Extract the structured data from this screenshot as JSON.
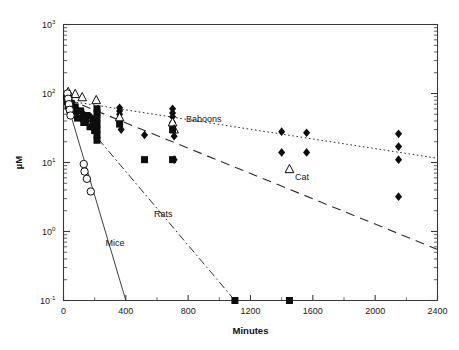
{
  "chart_data": {
    "type": "scatter",
    "title": "",
    "subtitle": "",
    "xlabel": "Minutes",
    "ylabel": "µM",
    "xlim": [
      0,
      2400
    ],
    "ylim": [
      0.1,
      1000
    ],
    "yscale": "log",
    "xscale": "linear",
    "grid": false,
    "legend_position": "inline-annotations",
    "xticks": [
      0,
      400,
      800,
      1200,
      1600,
      2000,
      2400
    ],
    "xtick_labels": [
      "0",
      "400",
      "800",
      "1200",
      "1600",
      "2000",
      "2400"
    ],
    "x_minor_tick_interval": 200,
    "yticks": [
      0.1,
      1,
      10,
      100,
      1000
    ],
    "ytick_labels": [
      "10-1",
      "100",
      "101",
      "102",
      "103"
    ],
    "ytick_mantissa": [
      "10",
      "10",
      "10",
      "10",
      "10"
    ],
    "ytick_exponent": [
      "-1",
      "0",
      "1",
      "2",
      "3"
    ],
    "annotations": [
      {
        "text": "Baboons",
        "x": 900,
        "y": 38
      },
      {
        "text": "Cat",
        "x": 1530,
        "y": 5.5
      },
      {
        "text": "Rats",
        "x": 640,
        "y": 1.6
      },
      {
        "text": "Mice",
        "x": 330,
        "y": 0.62
      }
    ],
    "series": [
      {
        "name": "Baboons",
        "marker": "filled-diamond",
        "line_style": "dotted",
        "fit_line": {
          "x": [
            30,
            2400
          ],
          "y": [
            78,
            11.5
          ]
        },
        "points": [
          {
            "x": 20,
            "y": 96
          },
          {
            "x": 25,
            "y": 88
          },
          {
            "x": 30,
            "y": 80
          },
          {
            "x": 30,
            "y": 62
          },
          {
            "x": 40,
            "y": 70
          },
          {
            "x": 45,
            "y": 58
          },
          {
            "x": 55,
            "y": 66
          },
          {
            "x": 60,
            "y": 52
          },
          {
            "x": 70,
            "y": 60
          },
          {
            "x": 80,
            "y": 48
          },
          {
            "x": 95,
            "y": 56
          },
          {
            "x": 110,
            "y": 44
          },
          {
            "x": 130,
            "y": 50
          },
          {
            "x": 150,
            "y": 40
          },
          {
            "x": 175,
            "y": 46
          },
          {
            "x": 190,
            "y": 36
          },
          {
            "x": 360,
            "y": 62
          },
          {
            "x": 360,
            "y": 56
          },
          {
            "x": 360,
            "y": 50
          },
          {
            "x": 360,
            "y": 42
          },
          {
            "x": 370,
            "y": 30
          },
          {
            "x": 520,
            "y": 25
          },
          {
            "x": 700,
            "y": 60
          },
          {
            "x": 700,
            "y": 52
          },
          {
            "x": 700,
            "y": 46
          },
          {
            "x": 700,
            "y": 38
          },
          {
            "x": 710,
            "y": 24
          },
          {
            "x": 710,
            "y": 11
          },
          {
            "x": 1400,
            "y": 28
          },
          {
            "x": 1400,
            "y": 14
          },
          {
            "x": 1560,
            "y": 27
          },
          {
            "x": 1560,
            "y": 14
          },
          {
            "x": 2150,
            "y": 26
          },
          {
            "x": 2150,
            "y": 17
          },
          {
            "x": 2150,
            "y": 11
          },
          {
            "x": 2150,
            "y": 3.2
          }
        ]
      },
      {
        "name": "Cat",
        "marker": "open-triangle",
        "line_style": "dashed",
        "fit_line": {
          "x": [
            30,
            2400
          ],
          "y": [
            82,
            0.55
          ]
        },
        "points": [
          {
            "x": 30,
            "y": 105
          },
          {
            "x": 75,
            "y": 98
          },
          {
            "x": 120,
            "y": 88
          },
          {
            "x": 210,
            "y": 80
          },
          {
            "x": 360,
            "y": 45
          },
          {
            "x": 700,
            "y": 38
          },
          {
            "x": 710,
            "y": 30
          },
          {
            "x": 1450,
            "y": 8.0
          }
        ]
      },
      {
        "name": "Rats",
        "marker": "filled-square",
        "line_style": "dash-dot",
        "fit_line": {
          "x": [
            30,
            1100
          ],
          "y": [
            72,
            0.1
          ]
        },
        "points": [
          {
            "x": 20,
            "y": 92
          },
          {
            "x": 25,
            "y": 76
          },
          {
            "x": 30,
            "y": 66
          },
          {
            "x": 35,
            "y": 84
          },
          {
            "x": 40,
            "y": 58
          },
          {
            "x": 50,
            "y": 72
          },
          {
            "x": 60,
            "y": 50
          },
          {
            "x": 75,
            "y": 64
          },
          {
            "x": 90,
            "y": 44
          },
          {
            "x": 110,
            "y": 56
          },
          {
            "x": 130,
            "y": 38
          },
          {
            "x": 150,
            "y": 48
          },
          {
            "x": 170,
            "y": 33
          },
          {
            "x": 190,
            "y": 42
          },
          {
            "x": 200,
            "y": 29
          },
          {
            "x": 215,
            "y": 60
          },
          {
            "x": 215,
            "y": 52
          },
          {
            "x": 215,
            "y": 44
          },
          {
            "x": 215,
            "y": 36
          },
          {
            "x": 215,
            "y": 30
          },
          {
            "x": 215,
            "y": 25
          },
          {
            "x": 215,
            "y": 21
          },
          {
            "x": 360,
            "y": 36
          },
          {
            "x": 520,
            "y": 11
          },
          {
            "x": 700,
            "y": 30
          },
          {
            "x": 700,
            "y": 11
          },
          {
            "x": 1100,
            "y": 0.1
          },
          {
            "x": 1450,
            "y": 0.1
          }
        ]
      },
      {
        "name": "Mice",
        "marker": "open-circle",
        "line_style": "solid",
        "fit_line": {
          "x": [
            20,
            400
          ],
          "y": [
            78,
            0.1
          ]
        },
        "points": [
          {
            "x": 25,
            "y": 100
          },
          {
            "x": 30,
            "y": 84
          },
          {
            "x": 35,
            "y": 70
          },
          {
            "x": 40,
            "y": 58
          },
          {
            "x": 45,
            "y": 48
          },
          {
            "x": 130,
            "y": 9.5
          },
          {
            "x": 135,
            "y": 7.4
          },
          {
            "x": 150,
            "y": 5.8
          },
          {
            "x": 175,
            "y": 3.8
          }
        ]
      }
    ]
  }
}
